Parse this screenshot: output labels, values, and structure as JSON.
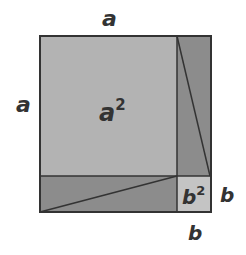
{
  "diagram": {
    "labels": {
      "top_a": "a",
      "left_a": "a",
      "big_square": "a",
      "big_square_exp": "2",
      "small_square": "b",
      "small_square_exp": "2",
      "right_b": "b",
      "bottom_b": "b"
    },
    "colors": {
      "big_square": "#b3b3b3",
      "rectangles": "#8c8c8c",
      "small_square": "#c4c4c4",
      "stroke": "#333333"
    }
  }
}
